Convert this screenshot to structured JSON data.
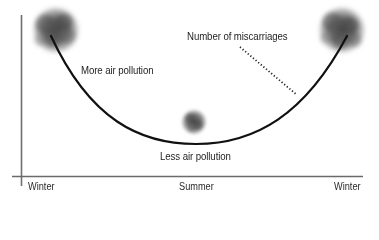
{
  "diagram": {
    "type": "conceptual-curve",
    "curve_label": "Number of miscarriages",
    "annotations": {
      "high_left": "More air pollution",
      "low_middle": "Less air pollution"
    },
    "x_axis": {
      "ticks": [
        "Winter",
        "Summer",
        "Winter"
      ]
    },
    "y_axis": {
      "label": ""
    },
    "colors": {
      "axis": "#6e6e6e",
      "curve": "#111111",
      "smog": "#555555",
      "leader_line": "#222222"
    }
  }
}
